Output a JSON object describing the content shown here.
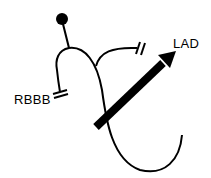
{
  "diagram": {
    "labels": {
      "rbbb": "RBBB",
      "lad": "LAD"
    },
    "colors": {
      "stroke": "#000000",
      "background": "#ffffff"
    },
    "elements": [
      {
        "type": "dot",
        "name": "his-bundle-origin"
      },
      {
        "type": "line",
        "name": "main-stem"
      },
      {
        "type": "branch",
        "name": "right-bundle-branch",
        "blocked": true,
        "label": "RBBB"
      },
      {
        "type": "branch",
        "name": "left-anterior-fascicle",
        "blocked": true
      },
      {
        "type": "branch",
        "name": "left-posterior-fascicle",
        "blocked": false
      },
      {
        "type": "arrow",
        "name": "axis-arrow",
        "label": "LAD"
      }
    ]
  }
}
